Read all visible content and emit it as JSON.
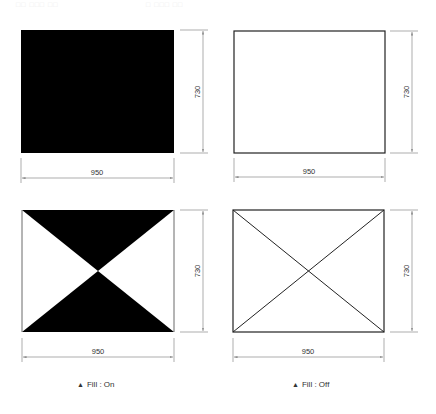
{
  "header": {
    "faint_left": "□□  □□□  □□",
    "faint_right": "□  □□□  □□"
  },
  "colors": {
    "fill": "#000000",
    "stroke": "#222222",
    "dimension": "#8a8a8a",
    "background": "#ffffff"
  },
  "panels": [
    {
      "id": "fill-on-rect",
      "shape": "rectangle",
      "fill": "on",
      "width_label": "950",
      "height_label": "730"
    },
    {
      "id": "fill-off-rect",
      "shape": "rectangle",
      "fill": "off",
      "width_label": "950",
      "height_label": "730"
    },
    {
      "id": "fill-on-hourglass",
      "shape": "rectangle-with-diagonals",
      "fill": "on",
      "width_label": "950",
      "height_label": "730"
    },
    {
      "id": "fill-off-cross",
      "shape": "rectangle-with-diagonals",
      "fill": "off",
      "width_label": "950",
      "height_label": "730"
    }
  ],
  "captions": {
    "left": {
      "marker": "▲",
      "text": "Fill : On"
    },
    "right": {
      "marker": "▲",
      "text": "Fill : Off"
    }
  }
}
